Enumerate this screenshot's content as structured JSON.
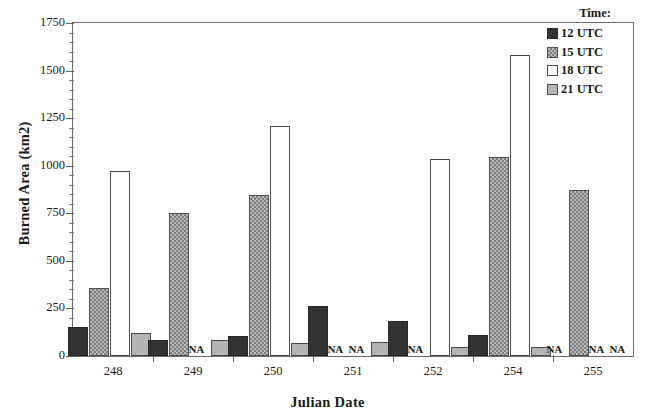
{
  "chart_data": {
    "type": "bar",
    "title": "",
    "xlabel": "Julian Date",
    "ylabel": "Burned Area (km2)",
    "categories": [
      "248",
      "249",
      "250",
      "251",
      "252",
      "254",
      "255"
    ],
    "ylim": [
      0,
      1750
    ],
    "ytick_step": 250,
    "yticks": [
      "0",
      "250",
      "500",
      "750",
      "1000",
      "1250",
      "1500",
      "1750"
    ],
    "minor_ticks_per_major": 5,
    "grid": false,
    "legend_title": "Time:",
    "legend_position": "top-right-inside",
    "na_text": "NA",
    "series": [
      {
        "name": "12 UTC",
        "color": "#333333",
        "fill": "solid-dark",
        "values": [
          150,
          85,
          105,
          265,
          185,
          110,
          null
        ]
      },
      {
        "name": "15 UTC",
        "color": "#b9b9b9",
        "fill": "checker-gray",
        "values": [
          355,
          750,
          845,
          null,
          null,
          1045,
          875
        ]
      },
      {
        "name": "18 UTC",
        "color": "#ffffff",
        "fill": "white",
        "values": [
          970,
          null,
          1210,
          null,
          1035,
          1580,
          null
        ]
      },
      {
        "name": "21 UTC",
        "color": "#b5b5b5",
        "fill": "light-gray",
        "values": [
          120,
          85,
          70,
          75,
          50,
          50,
          null
        ]
      }
    ]
  }
}
